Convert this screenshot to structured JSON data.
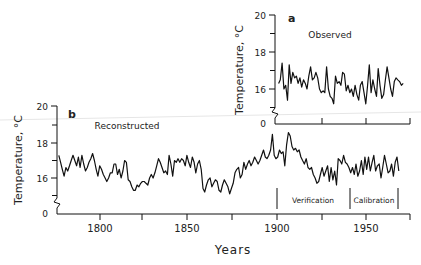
{
  "chart_data": [
    {
      "panel": "a",
      "type": "line",
      "title": "Observed",
      "xlabel": "",
      "ylabel": "Temperature, °C",
      "yticks": [
        "0",
        "16",
        "18",
        "20"
      ],
      "ylim": [
        14,
        20
      ],
      "xlim": [
        1898,
        1975
      ],
      "axis_break": true,
      "grid": false,
      "x": [
        1900,
        1901,
        1902,
        1903,
        1904,
        1905,
        1906,
        1907,
        1908,
        1909,
        1910,
        1911,
        1912,
        1913,
        1914,
        1915,
        1916,
        1917,
        1918,
        1919,
        1920,
        1921,
        1922,
        1923,
        1924,
        1925,
        1926,
        1927,
        1928,
        1929,
        1930,
        1931,
        1932,
        1933,
        1934,
        1935,
        1936,
        1937,
        1938,
        1939,
        1940,
        1941,
        1942,
        1943,
        1944,
        1945,
        1946,
        1947,
        1948,
        1949,
        1950,
        1951,
        1952,
        1953,
        1954,
        1955,
        1956,
        1957,
        1958,
        1959,
        1960,
        1961,
        1962,
        1963,
        1964,
        1965,
        1966,
        1967,
        1968,
        1969,
        1970
      ],
      "series": [
        {
          "name": "Observed",
          "values": [
            16.3,
            16.5,
            17.4,
            16.0,
            16.2,
            15.4,
            17.3,
            16.3,
            16.9,
            16.6,
            16.7,
            16.3,
            16.6,
            16.1,
            16.5,
            16.3,
            16.0,
            16.7,
            17.2,
            16.5,
            16.6,
            16.9,
            16.6,
            16.0,
            15.8,
            15.9,
            15.8,
            17.2,
            16.0,
            15.6,
            15.5,
            15.2,
            16.7,
            16.3,
            16.4,
            16.2,
            16.9,
            16.8,
            15.9,
            16.2,
            15.8,
            16.0,
            15.6,
            16.2,
            15.7,
            15.4,
            16.2,
            16.4,
            15.8,
            15.2,
            16.2,
            17.3,
            15.8,
            16.5,
            16.0,
            15.6,
            17.1,
            16.2,
            15.5,
            15.7,
            16.5,
            17.2,
            16.6,
            16.0,
            15.6,
            16.4,
            16.6,
            16.5,
            16.4,
            16.2,
            16.3
          ]
        }
      ]
    },
    {
      "panel": "b",
      "type": "line",
      "title": "Reconstructed",
      "xlabel": "Years",
      "ylabel": "Temperature, °C",
      "yticks": [
        "0",
        "16",
        "18",
        "20"
      ],
      "xticks": [
        "1800",
        "1850",
        "1900",
        "1950"
      ],
      "ylim": [
        14,
        20
      ],
      "xlim": [
        1776,
        1975
      ],
      "axis_break": true,
      "grid": false,
      "x": [
        1777,
        1778,
        1779,
        1780,
        1781,
        1782,
        1783,
        1784,
        1785,
        1786,
        1787,
        1788,
        1789,
        1790,
        1791,
        1792,
        1793,
        1794,
        1795,
        1796,
        1797,
        1798,
        1799,
        1800,
        1801,
        1802,
        1803,
        1804,
        1805,
        1806,
        1807,
        1808,
        1809,
        1810,
        1811,
        1812,
        1813,
        1814,
        1815,
        1816,
        1817,
        1818,
        1819,
        1820,
        1821,
        1822,
        1823,
        1824,
        1825,
        1826,
        1827,
        1828,
        1829,
        1830,
        1831,
        1832,
        1833,
        1834,
        1835,
        1836,
        1837,
        1838,
        1839,
        1840,
        1841,
        1842,
        1843,
        1844,
        1845,
        1846,
        1847,
        1848,
        1849,
        1850,
        1851,
        1852,
        1853,
        1854,
        1855,
        1856,
        1857,
        1858,
        1859,
        1860,
        1861,
        1862,
        1863,
        1864,
        1865,
        1866,
        1867,
        1868,
        1869,
        1870,
        1871,
        1872,
        1873,
        1874,
        1875,
        1876,
        1877,
        1878,
        1879,
        1880,
        1881,
        1882,
        1883,
        1884,
        1885,
        1886,
        1887,
        1888,
        1889,
        1890,
        1891,
        1892,
        1893,
        1894,
        1895,
        1896,
        1897,
        1898,
        1899,
        1900,
        1901,
        1902,
        1903,
        1904,
        1905,
        1906,
        1907,
        1908,
        1909,
        1910,
        1911,
        1912,
        1913,
        1914,
        1915,
        1916,
        1917,
        1918,
        1919,
        1920,
        1921,
        1922,
        1923,
        1924,
        1925,
        1926,
        1927,
        1928,
        1929,
        1930,
        1931,
        1932,
        1933,
        1934,
        1935,
        1936,
        1937,
        1938,
        1939,
        1940,
        1941,
        1942,
        1943,
        1944,
        1945,
        1946,
        1947,
        1948,
        1949,
        1950,
        1951,
        1952,
        1953,
        1954,
        1955,
        1956,
        1957,
        1958,
        1959,
        1960,
        1961,
        1962,
        1963,
        1964,
        1965,
        1966,
        1967,
        1968,
        1969,
        1970
      ],
      "series": [
        {
          "name": "Reconstructed",
          "values": [
            17.3,
            16.9,
            16.5,
            16.1,
            16.6,
            16.4,
            16.7,
            17.0,
            17.3,
            17.0,
            16.7,
            17.2,
            16.6,
            17.3,
            16.8,
            16.4,
            16.6,
            16.9,
            17.1,
            17.4,
            17.0,
            16.5,
            16.1,
            16.7,
            16.5,
            16.2,
            16.0,
            15.8,
            16.0,
            16.3,
            16.3,
            16.8,
            16.8,
            16.2,
            16.5,
            16.0,
            16.4,
            17.0,
            16.9,
            15.9,
            15.8,
            15.5,
            15.3,
            15.3,
            15.6,
            15.5,
            15.7,
            15.8,
            15.8,
            15.7,
            15.6,
            16.0,
            16.2,
            16.0,
            16.3,
            16.7,
            17.1,
            16.9,
            16.6,
            16.3,
            16.4,
            16.2,
            17.3,
            16.8,
            16.1,
            17.0,
            16.9,
            17.1,
            16.9,
            17.1,
            17.0,
            16.7,
            17.3,
            16.9,
            16.6,
            17.2,
            16.9,
            16.3,
            16.8,
            17.0,
            16.5,
            15.4,
            15.2,
            15.6,
            15.9,
            16.0,
            15.5,
            15.7,
            15.9,
            15.8,
            15.3,
            15.2,
            15.6,
            15.9,
            15.7,
            15.5,
            15.1,
            15.4,
            15.7,
            16.3,
            16.5,
            16.6,
            16.0,
            16.2,
            16.9,
            16.5,
            16.8,
            17.0,
            16.7,
            16.9,
            17.2,
            17.0,
            16.8,
            17.0,
            17.3,
            17.6,
            17.2,
            17.1,
            17.3,
            17.6,
            18.5,
            17.3,
            17.1,
            17.2,
            17.6,
            17.4,
            17.5,
            16.7,
            17.9,
            18.6,
            18.4,
            17.8,
            17.6,
            17.7,
            17.5,
            17.6,
            17.2,
            17.0,
            16.8,
            17.1,
            16.6,
            16.5,
            16.6,
            16.2,
            16.0,
            15.7,
            15.8,
            16.2,
            16.6,
            16.1,
            16.4,
            16.7,
            15.8,
            16.6,
            15.9,
            16.4,
            15.6,
            17.1,
            17.0,
            16.8,
            17.3,
            16.9,
            16.8,
            16.6,
            16.3,
            16.6,
            16.2,
            16.8,
            16.1,
            16.4,
            17.0,
            16.2,
            17.2,
            16.5,
            17.2,
            16.4,
            16.9,
            17.3,
            16.4,
            16.7,
            16.8,
            16.0,
            16.6,
            17.3,
            16.8,
            16.3,
            16.4,
            16.8,
            16.1,
            16.9,
            17.2,
            16.4
          ]
        }
      ],
      "annotations": [
        {
          "text": "Verification",
          "from": 1900,
          "to": 1941
        },
        {
          "text": "Calibration",
          "from": 1941,
          "to": 1968
        }
      ]
    }
  ],
  "panel_a": {
    "letter": "a",
    "title": "Observed",
    "ylabel": "Temperature, °C",
    "ytick_labels": {
      "t20": "20",
      "t18": "18",
      "t16": "16",
      "t0": "0"
    }
  },
  "panel_b": {
    "letter": "b",
    "title": "Reconstructed",
    "ylabel": "Temperature, °C",
    "ytick_labels": {
      "t20": "20",
      "t18": "18",
      "t16": "16",
      "t0": "0"
    },
    "xtick_labels": {
      "t1800": "1800",
      "t1850": "1850",
      "t1900": "1900",
      "t1950": "1950"
    },
    "xlabel": "Years",
    "verification_label": "Verification",
    "calibration_label": "Calibration"
  }
}
